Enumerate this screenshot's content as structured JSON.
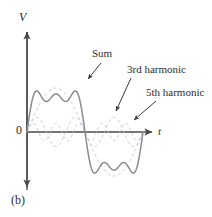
{
  "figure": {
    "caption": "(b)",
    "background_color": "#ffffff"
  },
  "axes": {
    "y_label": "V",
    "x_label": "t",
    "origin_label": "0",
    "axis_color": "#4a4a4a"
  },
  "annotations": {
    "sum": "Sum",
    "third_harmonic": "3rd harmonic",
    "fifth_harmonic": "5th harmonic"
  },
  "colors": {
    "sum_curve": "#8a8a92",
    "harmonic_curve": "#c9c9cf",
    "axis": "#4a4a4a",
    "text": "#2b2b2b",
    "leader": "#3a3a3a"
  },
  "chart_data": {
    "type": "line",
    "title": "",
    "subtitle": "",
    "xlabel": "t",
    "ylabel": "V",
    "grid": false,
    "legend": "annotated-inline",
    "xlim": [
      0,
      1
    ],
    "ylim": [
      -1.45,
      1.45
    ],
    "series": [
      {
        "name": "Sum",
        "style": "solid",
        "color": "#8a8a92",
        "amplitude": 1.18,
        "formula": "sin(2*pi*x) + sin(6*pi*x)/3 + sin(10*pi*x)/5",
        "samples": 601
      },
      {
        "name": "3rd harmonic",
        "style": "dashed",
        "color": "#c9c9cf",
        "amplitude": 0.333,
        "formula": "sin(6*pi*x)/3",
        "samples": 601
      },
      {
        "name": "5th harmonic",
        "style": "dashed",
        "color": "#c9c9cf",
        "amplitude": 0.2,
        "formula": "sin(10*pi*x)/5",
        "samples": 601
      },
      {
        "name": "Fundamental",
        "style": "dashed",
        "color": "#c9c9cf",
        "amplitude": 1.0,
        "formula": "sin(2*pi*x)",
        "samples": 601
      }
    ],
    "annotations": [
      {
        "text": "Sum",
        "target_x": 0.45,
        "target_series": "Sum",
        "leader": true
      },
      {
        "text": "3rd harmonic",
        "target_x": 0.61,
        "target_series": "3rd harmonic",
        "leader": true
      },
      {
        "text": "5th harmonic",
        "target_x": 0.78,
        "target_series": "5th harmonic",
        "leader": true
      }
    ]
  },
  "geometry": {
    "origin_px": {
      "x": 27,
      "y": 132
    },
    "x_axis_end_px": 155,
    "y_axis_top_px": 28,
    "y_axis_bottom_px": 190,
    "x_scale_px": 116,
    "y_scale_px": 44
  }
}
